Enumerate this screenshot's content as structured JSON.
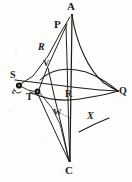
{
  "figure": {
    "kind": "geometric-diagram",
    "caption": "",
    "background_color": "#fdfdfb",
    "ink_color": "#1a1a18",
    "width": 132,
    "height": 182
  },
  "points": [
    {
      "id": "A",
      "label": "A",
      "style": "serif",
      "size": "lg",
      "x": 72,
      "y": 14,
      "label_x": 68,
      "label_y": 2,
      "marked": false
    },
    {
      "id": "P",
      "label": "P",
      "style": "serif",
      "size": "lg",
      "x": 64,
      "y": 27,
      "label_x": 56,
      "label_y": 21,
      "marked": false
    },
    {
      "id": "R2",
      "label": "R",
      "style": "ital",
      "size": "md",
      "x": 44,
      "y": 52,
      "label_x": 39,
      "label_y": 43,
      "marked": false
    },
    {
      "id": "V",
      "label": "V",
      "style": "serif",
      "size": "sm",
      "x": 48,
      "y": 68,
      "label_x": 43,
      "label_y": 60,
      "marked": false
    },
    {
      "id": "S",
      "label": "S",
      "style": "serif",
      "size": "md",
      "x": 18,
      "y": 84,
      "label_x": 11,
      "label_y": 72,
      "marked": true
    },
    {
      "id": "c",
      "label": "c",
      "style": "ital",
      "size": "sm",
      "x": 19,
      "y": 86,
      "label_x": 13,
      "label_y": 87,
      "marked": false
    },
    {
      "id": "T",
      "label": "T",
      "style": "serif",
      "size": "md",
      "x": 38,
      "y": 92,
      "label_x": 27,
      "label_y": 93,
      "marked": true
    },
    {
      "id": "Q",
      "label": "Q",
      "style": "serif",
      "size": "md",
      "x": 118,
      "y": 91,
      "label_x": 119,
      "label_y": 88,
      "marked": false
    },
    {
      "id": "R",
      "label": "R",
      "style": "serif",
      "size": "md",
      "x": 68,
      "y": 97,
      "label_x": 66,
      "label_y": 90,
      "marked": false
    },
    {
      "id": "W",
      "label": "W",
      "style": "serif",
      "size": "sm",
      "x": 58,
      "y": 112,
      "label_x": 54,
      "label_y": 110,
      "marked": false
    },
    {
      "id": "X",
      "label": "X",
      "style": "ital",
      "size": "md",
      "x": 92,
      "y": 118,
      "label_x": 88,
      "label_y": 112,
      "marked": false
    },
    {
      "id": "C",
      "label": "C",
      "style": "serif",
      "size": "lg",
      "x": 70,
      "y": 163,
      "label_x": 66,
      "label_y": 166,
      "marked": false
    }
  ],
  "segments": [
    {
      "name": "A-to-C-axis",
      "from": "A",
      "to": "C"
    },
    {
      "name": "P-to-S",
      "from": "P",
      "to": "S"
    },
    {
      "name": "P-to-T",
      "from": "P",
      "to": "T"
    },
    {
      "name": "P-to-C",
      "from": "P",
      "to": "C"
    },
    {
      "name": "S-to-Q-chord",
      "from": "S",
      "to": "Q"
    },
    {
      "name": "T-to-C",
      "from": "T",
      "to": "C"
    },
    {
      "name": "T-to-W-to-C",
      "from": "T",
      "to": "C"
    },
    {
      "name": "V-to-C",
      "from": "V",
      "to": "C"
    },
    {
      "name": "S-to-T-short",
      "from": "S",
      "to": "T"
    },
    {
      "name": "X-tick-mark",
      "from": "X",
      "to": "X"
    }
  ],
  "curves": [
    {
      "name": "arc-A-to-Q",
      "from": "A",
      "to": "Q"
    },
    {
      "name": "arc-upper-lens",
      "from": "V",
      "to": "Q"
    },
    {
      "name": "arc-lower-lens",
      "from": "T",
      "to": "Q"
    }
  ]
}
